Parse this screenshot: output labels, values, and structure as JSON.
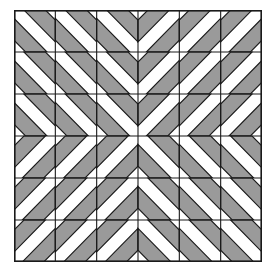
{
  "figure": {
    "name": "diagonal-stripe-quilt-pattern",
    "kind": "geometric-tile-pattern"
  },
  "canvas": {
    "width": 276,
    "height": 274,
    "background": "#ffffff"
  },
  "grid": {
    "origin_x": 14,
    "origin_y": 10,
    "cols": 6,
    "rows": 6,
    "cell_w": 41.33,
    "cell_h": 42.0,
    "line_color": "#1a1a1a",
    "line_width": 1.1,
    "outer_border_width": 1.6
  },
  "style": {
    "stripe_fill": "#9a9a9a",
    "stripe_outline": "#1a1a1a",
    "stripe_outline_width": 1.1,
    "tile_fill": "#ffffff"
  },
  "tile_geometry": {
    "note": "Within each unit square (0..1), stripes are bands perpendicular-offset along the diagonal",
    "band_offsets": [
      0.12,
      0.6
    ],
    "band_thickness": 0.26
  },
  "orientations": {
    "legend": {
      "B": "backslash — stripes run from upper-left to lower-right",
      "F": "forward-slash — stripes run from lower-left to upper-right"
    },
    "rows": [
      [
        "B",
        "B",
        "B",
        "F",
        "F",
        "F"
      ],
      [
        "B",
        "B",
        "B",
        "F",
        "F",
        "F"
      ],
      [
        "B",
        "B",
        "B",
        "F",
        "F",
        "F"
      ],
      [
        "F",
        "F",
        "F",
        "B",
        "B",
        "B"
      ],
      [
        "F",
        "F",
        "F",
        "B",
        "B",
        "B"
      ],
      [
        "F",
        "F",
        "F",
        "B",
        "B",
        "B"
      ]
    ]
  },
  "chart_data": {
    "type": "heatmap",
    "title": "",
    "xlabel": "",
    "ylabel": "",
    "categories": [
      "c1",
      "c2",
      "c3",
      "c4",
      "c5",
      "c6"
    ],
    "rows": [
      "r1",
      "r2",
      "r3",
      "r4",
      "r5",
      "r6"
    ],
    "values": [
      [
        0,
        0,
        0,
        1,
        1,
        1
      ],
      [
        0,
        0,
        0,
        1,
        1,
        1
      ],
      [
        0,
        0,
        0,
        1,
        1,
        1
      ],
      [
        1,
        1,
        1,
        0,
        0,
        0
      ],
      [
        1,
        1,
        1,
        0,
        0,
        0
      ],
      [
        1,
        1,
        1,
        0,
        0,
        0
      ]
    ],
    "value_meaning": {
      "0": "backslash stripes",
      "1": "forward-slash stripes"
    },
    "legend": [
      "backslash stripes",
      "forward-slash stripes"
    ],
    "grid": true,
    "legend_position": "none"
  }
}
